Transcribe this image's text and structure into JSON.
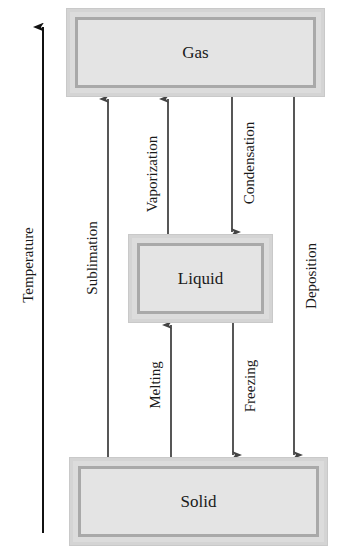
{
  "axis": {
    "label": "Temperature"
  },
  "states": {
    "gas": "Gas",
    "liquid": "Liquid",
    "solid": "Solid"
  },
  "transitions": {
    "sublimation": "Sublimation",
    "vaporization": "Vaporization",
    "condensation": "Condensation",
    "deposition": "Deposition",
    "melting": "Melting",
    "freezing": "Freezing"
  },
  "colors": {
    "arrow": "#444444",
    "axis": "#111111",
    "box_fill": "#e4e4e4"
  }
}
